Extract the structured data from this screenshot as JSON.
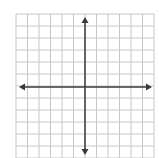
{
  "diagram": {
    "type": "coordinate-plane",
    "grid": {
      "columns": 12,
      "rows": 12,
      "left": 16,
      "top": 14,
      "right": 154,
      "bottom": 158,
      "line_color": "#c8c8c8"
    },
    "axes": {
      "color": "#3a3a3a",
      "x_axis_y": 87,
      "y_axis_x": 85,
      "x_arrow_left": 19,
      "x_arrow_right": 152,
      "y_arrow_top": 17,
      "y_arrow_bottom": 155,
      "arrowheads": "both-ends"
    },
    "labels": []
  }
}
